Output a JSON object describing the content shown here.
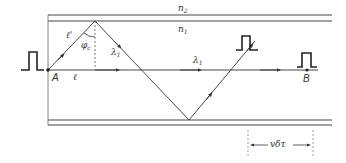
{
  "diagram": {
    "type": "optical-fiber-multipath-dispersion",
    "colors": {
      "line": "#333333",
      "guide": "#444444",
      "dashed": "#888888",
      "background": "#ffffff"
    },
    "media": {
      "cladding_label": "n",
      "cladding_sub": "2",
      "core_label": "n",
      "core_sub": "1"
    },
    "points": {
      "start": "A",
      "end": "B"
    },
    "rays": {
      "axial_length_label": "ℓ",
      "oblique_length_label": "ℓ'",
      "critical_angle_label": "φ",
      "critical_angle_sub": "c",
      "oblique_wavelength_label": "λ",
      "oblique_wavelength_sub": "1",
      "axial_wavelength_label": "λ",
      "axial_wavelength_sub": "1"
    },
    "spread": {
      "label": "vδτ"
    }
  }
}
